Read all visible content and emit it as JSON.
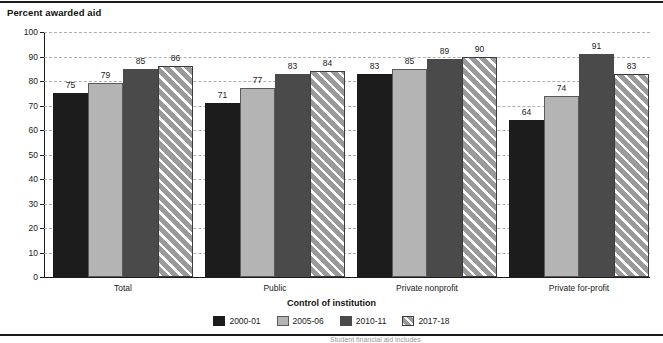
{
  "chart_data": {
    "type": "bar",
    "title": "Percent awarded aid",
    "xlabel": "Control of institution",
    "ylabel": "",
    "ylim": [
      0,
      100
    ],
    "yticks": [
      0,
      10,
      20,
      30,
      40,
      50,
      60,
      70,
      80,
      90,
      100
    ],
    "ytick_labels": [
      "0",
      "10",
      "20",
      "30",
      "40",
      "50",
      "60",
      "70",
      "80",
      "90",
      "100"
    ],
    "grid": true,
    "legend_position": "bottom-center",
    "categories": [
      "Total",
      "Public",
      "Private nonprofit",
      "Private for-profit"
    ],
    "series": [
      {
        "name": "2000-01",
        "color": "#1c1c1c",
        "pattern": "solid",
        "values": [
          75,
          71,
          83,
          64
        ]
      },
      {
        "name": "2005-06",
        "color": "#b4b4b4",
        "pattern": "solid",
        "values": [
          79,
          77,
          85,
          74
        ]
      },
      {
        "name": "2010-11",
        "color": "#4a4a4a",
        "pattern": "solid",
        "values": [
          85,
          83,
          89,
          91
        ]
      },
      {
        "name": "2017-18",
        "color": "#9a9a9a",
        "pattern": "diagonal-hatch",
        "values": [
          86,
          84,
          90,
          83
        ]
      }
    ]
  },
  "footer": {
    "source_note": "Student financial aid includes"
  }
}
